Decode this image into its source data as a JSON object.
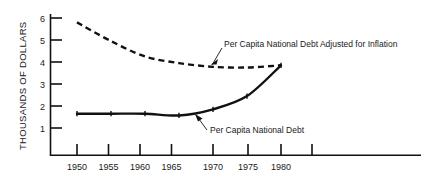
{
  "chart_data": {
    "type": "line",
    "title": "",
    "xlabel": "",
    "ylabel": "THOUSANDS OF DOLLARS",
    "x": [
      1950,
      1955,
      1960,
      1965,
      1970,
      1975,
      1980
    ],
    "xtick_labels": [
      "1950",
      "1955",
      "1960",
      "1965",
      "1970",
      "1975",
      "1980"
    ],
    "ytick_labels": [
      "1",
      "2",
      "3",
      "4",
      "5",
      "6"
    ],
    "yticks": [
      1,
      2,
      3,
      4,
      5,
      6
    ],
    "xlim": [
      1946.5,
      1988
    ],
    "ylim": [
      0,
      6.35
    ],
    "grid": false,
    "legend": "none",
    "series": [
      {
        "name": "Per Capita National Debt Adjusted for Inflation",
        "style": "dashed",
        "values": [
          5.8,
          4.95,
          4.25,
          3.95,
          3.78,
          3.75,
          3.85
        ]
      },
      {
        "name": "Per Capita National Debt",
        "style": "solid",
        "values": [
          1.65,
          1.65,
          1.65,
          1.57,
          1.85,
          2.45,
          3.85
        ]
      }
    ],
    "annotations": [
      {
        "id": "annotation-inflation",
        "text": "Per Capita National Debt Adjusted for Inflation",
        "points_to": {
          "x": 1969.5,
          "y": 3.8
        }
      },
      {
        "id": "annotation-debt",
        "text": "Per Capita National Debt",
        "points_to": {
          "x": 1966.8,
          "y": 1.6
        }
      }
    ],
    "extra_unlabeled_xtick": 1985
  }
}
